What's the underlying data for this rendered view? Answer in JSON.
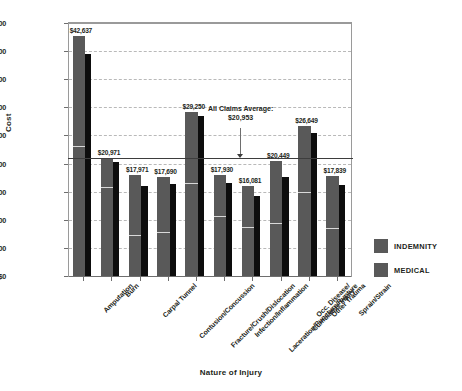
{
  "chart_data": {
    "type": "bar",
    "title": "",
    "xlabel": "Nature of Injury",
    "ylabel": "Cost",
    "ylim": [
      0,
      45000
    ],
    "ytick_labels": [
      "$45,000",
      "$40,000",
      "$35,000",
      "$30,000",
      "$25,000",
      "$20,000",
      "$15,000",
      "$10,000",
      "$5,000",
      "$0"
    ],
    "ytick_values": [
      45000,
      40000,
      35000,
      30000,
      25000,
      20000,
      15000,
      10000,
      5000,
      0
    ],
    "grid": true,
    "legend_position": "right",
    "categories": [
      "Amputation",
      "Burn",
      "Carpal Tunnel",
      "Contusion/Concussion",
      "Fracture/Crush/Dislocation",
      "Infection/Inflammation",
      "Laceration/Puncture/Rupture",
      "Occ. Disease/ Cumulative Injury",
      "Other Trauma",
      "Sprain/Strain"
    ],
    "category_lines": [
      [
        "Amputation"
      ],
      [
        "Burn"
      ],
      [
        "Carpal Tunnel"
      ],
      [
        "Contusion/Concussion"
      ],
      [
        "Fracture/Crush/Dislocation"
      ],
      [
        "Infection/Inflammation"
      ],
      [
        "Laceration/Puncture/Rupture"
      ],
      [
        "Occ. Disease/",
        "Cumulative Injury"
      ],
      [
        "Other Trauma"
      ],
      [
        "Sprain/Strain"
      ]
    ],
    "data_labels": [
      "$42,637",
      "$20,971",
      "$17,971",
      "$17,690",
      "$29,250",
      "$17,930",
      "$16,081",
      "$20,449",
      "$26,649",
      "$17,839"
    ],
    "total_values": [
      42637,
      20971,
      17971,
      17690,
      29250,
      17930,
      16081,
      20449,
      26649,
      17839
    ],
    "series": [
      {
        "name": "INDEMNITY",
        "color": "#595959",
        "values": [
          42637,
          20971,
          17971,
          17690,
          29250,
          17930,
          16081,
          20449,
          26649,
          17839
        ],
        "split_values": [
          22900,
          15600,
          7100,
          7700,
          16400,
          10450,
          8600,
          9200,
          14700,
          8400
        ]
      },
      {
        "name": "MEDICAL",
        "color": "#0d0d0d",
        "values": [
          39500,
          20300,
          16000,
          16400,
          28400,
          16500,
          14300,
          17600,
          25400,
          16200
        ]
      }
    ],
    "reference_line": {
      "label": "All Claims Average:",
      "value_label": "$20,953",
      "value": 20953
    }
  },
  "legend": {
    "items": [
      {
        "label": "INDEMNITY",
        "color": "#595959"
      },
      {
        "label": "MEDICAL",
        "color": "#595959"
      }
    ]
  }
}
